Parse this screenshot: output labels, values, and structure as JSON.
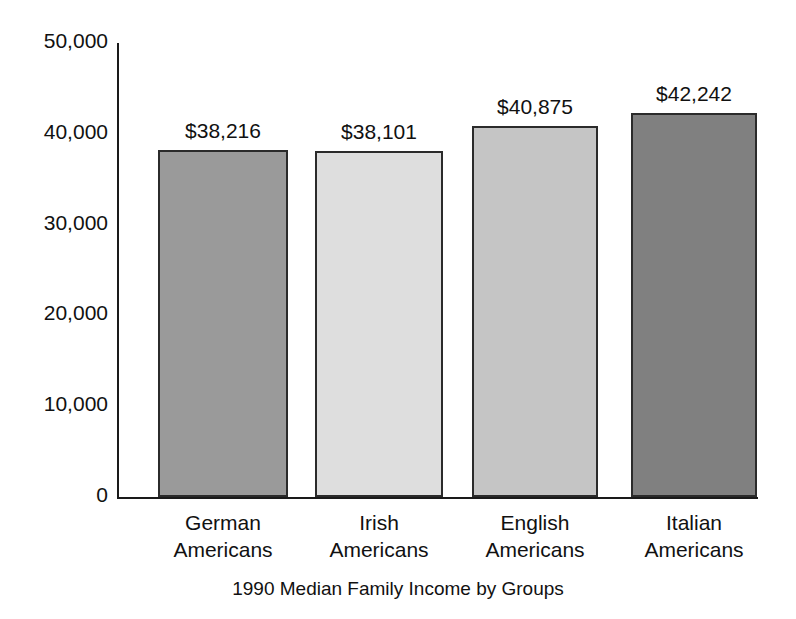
{
  "chart_data": {
    "type": "bar",
    "title": "1990 Median Family Income by Groups",
    "title_position": "bottom",
    "xlabel": "",
    "ylabel": "",
    "ylim": [
      0,
      50000
    ],
    "grid": false,
    "legend": "none",
    "ytick_labels": [
      "50,000",
      "40,000",
      "30,000",
      "20,000",
      "10,000",
      "0"
    ],
    "ytick_values": [
      50000,
      40000,
      30000,
      20000,
      10000,
      0
    ],
    "categories": [
      "German Americans",
      "Irish Americans",
      "English Americans",
      "Italian Americans"
    ],
    "category_lines": [
      [
        "German",
        "Americans"
      ],
      [
        "Irish",
        "Americans"
      ],
      [
        "English",
        "Americans"
      ],
      [
        "Italian",
        "Americans"
      ]
    ],
    "values": [
      38216,
      38101,
      40875,
      42242
    ],
    "value_labels": [
      "$38,216",
      "$38,101",
      "$40,875",
      "$42,242"
    ],
    "bar_colors": [
      "#9a9a9a",
      "#dedede",
      "#c5c5c5",
      "#808080"
    ],
    "bar_edge_color": "#2b2b2b",
    "axis_color": "#1a1a1a",
    "background": "#ffffff"
  },
  "geometry": {
    "plot_left": 117,
    "plot_top": 43,
    "plot_baseline": 497,
    "plot_right": 758,
    "bars": [
      {
        "x": 158,
        "width": 130
      },
      {
        "x": 315,
        "width": 128
      },
      {
        "x": 472,
        "width": 126
      },
      {
        "x": 631,
        "width": 126
      }
    ]
  }
}
